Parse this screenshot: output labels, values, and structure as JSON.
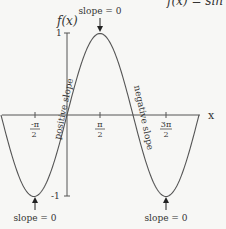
{
  "chart_data": {
    "type": "line",
    "title": "f(x) = sin x",
    "xlabel": "x",
    "ylabel": "f(x)",
    "x_ticks": [
      "-π/2",
      "π/2",
      "3π/2"
    ],
    "y_ticks": [
      "1",
      "-1"
    ],
    "xlim": [
      -3.1416,
      6.2832
    ],
    "ylim": [
      -1,
      1
    ],
    "series": [
      {
        "name": "sin x",
        "x": [
          -3.1416,
          -1.5708,
          0,
          1.5708,
          3.1416,
          4.7124,
          6.2832
        ],
        "y": [
          0,
          -1,
          0,
          1,
          0,
          -1,
          0
        ]
      }
    ],
    "annotations": [
      {
        "text": "slope = 0",
        "x": 1.5708,
        "y": 1
      },
      {
        "text": "slope = 0",
        "x": -1.5708,
        "y": -1
      },
      {
        "text": "slope = 0",
        "x": 4.7124,
        "y": -1
      },
      {
        "text": "positive slope",
        "x": 0,
        "y": 0
      },
      {
        "text": "negative slope",
        "x": 3.1416,
        "y": 0
      }
    ],
    "grid": false
  },
  "labels": {
    "title": "f(x) = sin x",
    "ylabel": "f(x)",
    "xlabel": "x",
    "y_top": "1",
    "y_bottom": "-1",
    "tick_neg_pi_half_num": "-π",
    "tick_neg_pi_half_den": "2",
    "tick_pi_half_num": "π",
    "tick_pi_half_den": "2",
    "tick_3pi_half_num": "3π",
    "tick_3pi_half_den": "2",
    "slope_top": "slope = 0",
    "slope_left": "slope = 0",
    "slope_right": "slope = 0",
    "positive_slope": "positive slope",
    "negative_slope": "negative slope"
  },
  "colors": {
    "curve": "#555555",
    "axis": "#555555",
    "text": "#333333",
    "background": "#f7f7f5"
  }
}
